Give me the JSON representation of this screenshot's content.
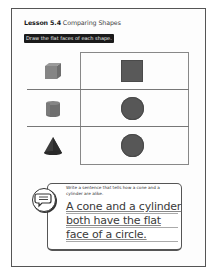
{
  "header": {
    "lesson_label": "Lesson 5.4",
    "lesson_title": "Comparing Shapes"
  },
  "instruction_banner": "Draw the flat faces of each shape.",
  "table": {
    "rows": [
      {
        "solid": "cube-icon",
        "solid_name": "cube",
        "face": "square",
        "face_color": "#595959"
      },
      {
        "solid": "cylinder-icon",
        "solid_name": "cylinder",
        "face": "circle",
        "face_color": "#575757"
      },
      {
        "solid": "cone-icon",
        "solid_name": "cone",
        "face": "circle",
        "face_color": "#575757"
      }
    ]
  },
  "writing": {
    "icon": "speech-bubble-icon",
    "prompt": "Write a sentence that tells how a cone and a cylinder are alike.",
    "answer_lines": [
      "A cone and a cylinder",
      "both have the flat",
      "face of a circle."
    ]
  },
  "colors": {
    "border": "#555555",
    "banner_bg": "#1a1a1a",
    "banner_text": "#f2f2f2",
    "shape_fill": "#595959"
  }
}
